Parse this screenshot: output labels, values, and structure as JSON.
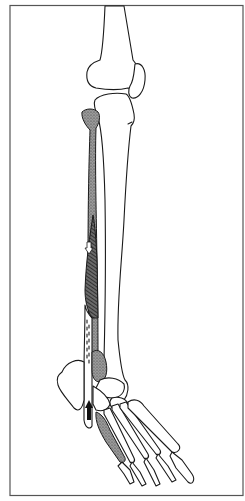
{
  "figure": {
    "type": "anatomical-illustration",
    "elements": [
      {
        "name": "femur",
        "shaded": false
      },
      {
        "name": "patella",
        "shaded": false
      },
      {
        "name": "tibia",
        "shaded": false
      },
      {
        "name": "fibula",
        "shaded": true
      },
      {
        "name": "muscle-belly",
        "hatched": true
      },
      {
        "name": "tendon",
        "shaded": false
      },
      {
        "name": "lateral-malleolus",
        "shaded": true
      },
      {
        "name": "calcaneus",
        "shaded": false
      },
      {
        "name": "fifth-metatarsal",
        "shaded": true
      },
      {
        "name": "foot-bones",
        "shaded": false
      }
    ],
    "arrows": [
      {
        "name": "down-arrow",
        "direction": "down",
        "style": "outline",
        "location": "muscle-belly"
      },
      {
        "name": "up-arrow",
        "direction": "up",
        "style": "solid",
        "location": "tendon-at-ankle"
      }
    ],
    "colors": {
      "line": "#1a1a1a",
      "background": "#ffffff",
      "frame": "#555555",
      "shade": "#8a8a8a",
      "hatch": "#222222"
    }
  }
}
